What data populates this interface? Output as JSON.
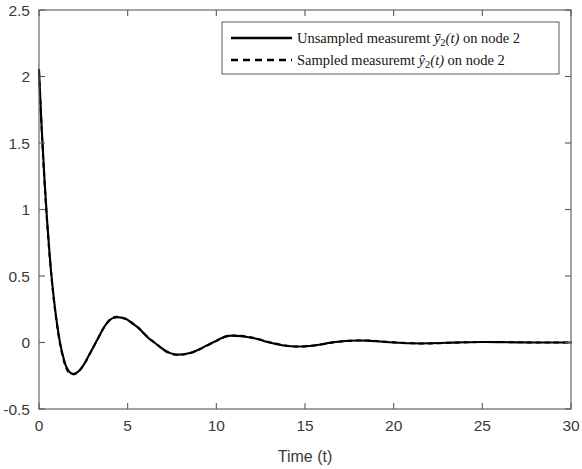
{
  "chart_data": {
    "type": "line",
    "title": "",
    "xlabel": "Time (t)",
    "ylabel": "",
    "xlim": [
      0,
      30
    ],
    "ylim": [
      -0.5,
      2.5
    ],
    "xticks": [
      0,
      5,
      10,
      15,
      20,
      25,
      30
    ],
    "xticklabels": [
      "0",
      "5",
      "10",
      "15",
      "20",
      "25",
      "30"
    ],
    "yticks": [
      -0.5,
      0,
      0.5,
      1,
      1.5,
      2,
      2.5
    ],
    "yticklabels": [
      "-0.5",
      "0",
      "0.5",
      "1",
      "1.5",
      "2",
      "2.5"
    ],
    "grid": false,
    "legend_position": "top-center",
    "series": [
      {
        "name": "Unsampled measuremt ȳ2(t) on node 2",
        "label_prefix": "Unsampled measuremt",
        "label_symbol": "y",
        "label_accent": "bar",
        "label_subscript": "2",
        "label_arg": "(t)",
        "label_suffix": "on node 2",
        "style": "solid",
        "color": "#000000",
        "x": [
          0,
          0.15,
          0.3,
          0.45,
          0.6,
          0.75,
          0.9,
          1.05,
          1.2,
          1.35,
          1.5,
          1.65,
          1.8,
          2.0,
          2.2,
          2.4,
          2.6,
          2.8,
          3.0,
          3.2,
          3.4,
          3.6,
          3.8,
          4.0,
          4.2,
          4.4,
          4.6,
          4.8,
          5.0,
          5.3,
          5.6,
          5.9,
          6.2,
          6.5,
          6.8,
          7.1,
          7.4,
          7.7,
          8.0,
          8.3,
          8.6,
          8.9,
          9.2,
          9.5,
          9.8,
          10.1,
          10.4,
          10.7,
          11.0,
          11.4,
          11.8,
          12.2,
          12.6,
          13.0,
          13.4,
          13.8,
          14.2,
          14.6,
          15.0,
          15.5,
          16.0,
          16.5,
          17.0,
          17.5,
          18.0,
          18.5,
          19.0,
          19.5,
          20.0,
          20.5,
          21.0,
          21.5,
          22.0,
          23.0,
          24.0,
          25.0,
          26.0,
          27.0,
          28.0,
          29.0,
          30.0
        ],
        "y": [
          2.05,
          1.62,
          1.25,
          0.93,
          0.66,
          0.44,
          0.26,
          0.11,
          -0.01,
          -0.1,
          -0.17,
          -0.21,
          -0.23,
          -0.235,
          -0.22,
          -0.19,
          -0.15,
          -0.1,
          -0.05,
          0.0,
          0.05,
          0.1,
          0.14,
          0.17,
          0.185,
          0.19,
          0.188,
          0.18,
          0.17,
          0.14,
          0.11,
          0.07,
          0.03,
          0.0,
          -0.03,
          -0.06,
          -0.08,
          -0.09,
          -0.09,
          -0.085,
          -0.075,
          -0.06,
          -0.04,
          -0.02,
          0.0,
          0.02,
          0.04,
          0.05,
          0.05,
          0.048,
          0.04,
          0.03,
          0.015,
          0.0,
          -0.012,
          -0.022,
          -0.028,
          -0.03,
          -0.028,
          -0.022,
          -0.012,
          0.0,
          0.008,
          0.013,
          0.015,
          0.014,
          0.01,
          0.005,
          0.0,
          -0.004,
          -0.006,
          -0.007,
          -0.006,
          -0.002,
          0.002,
          0.004,
          0.003,
          0.001,
          0.0,
          0.0,
          0.0
        ]
      },
      {
        "name": "Sampled measuremt ŷ2(t) on node 2",
        "label_prefix": "Sampled measuremt",
        "label_symbol": "y",
        "label_accent": "hat",
        "label_subscript": "2",
        "label_arg": "(t)",
        "label_suffix": "on node 2",
        "style": "dashed",
        "color": "#000000",
        "x": [
          0,
          0.15,
          0.3,
          0.45,
          0.6,
          0.75,
          0.9,
          1.05,
          1.2,
          1.35,
          1.5,
          1.65,
          1.8,
          2.0,
          2.2,
          2.4,
          2.6,
          2.8,
          3.0,
          3.2,
          3.4,
          3.6,
          3.8,
          4.0,
          4.2,
          4.4,
          4.6,
          4.8,
          5.0,
          5.3,
          5.6,
          5.9,
          6.2,
          6.5,
          6.8,
          7.1,
          7.4,
          7.7,
          8.0,
          8.3,
          8.6,
          8.9,
          9.2,
          9.5,
          9.8,
          10.1,
          10.4,
          10.7,
          11.0,
          11.4,
          11.8,
          12.2,
          12.6,
          13.0,
          13.4,
          13.8,
          14.2,
          14.6,
          15.0,
          15.5,
          16.0,
          16.5,
          17.0,
          17.5,
          18.0,
          18.5,
          19.0,
          19.5,
          20.0,
          20.5,
          21.0,
          21.5,
          22.0,
          23.0,
          24.0,
          25.0,
          26.0,
          27.0,
          28.0,
          29.0,
          30.0
        ],
        "y": [
          2.03,
          1.6,
          1.23,
          0.92,
          0.65,
          0.43,
          0.25,
          0.1,
          -0.02,
          -0.11,
          -0.18,
          -0.22,
          -0.235,
          -0.238,
          -0.222,
          -0.192,
          -0.152,
          -0.102,
          -0.052,
          -0.002,
          0.048,
          0.1,
          0.142,
          0.172,
          0.188,
          0.193,
          0.19,
          0.182,
          0.172,
          0.142,
          0.112,
          0.072,
          0.032,
          0.002,
          -0.032,
          -0.062,
          -0.082,
          -0.092,
          -0.092,
          -0.087,
          -0.077,
          -0.062,
          -0.042,
          -0.022,
          -0.002,
          0.018,
          0.038,
          0.052,
          0.052,
          0.05,
          0.042,
          0.032,
          0.017,
          0.002,
          -0.01,
          -0.02,
          -0.027,
          -0.03,
          -0.029,
          -0.023,
          -0.013,
          -0.001,
          0.007,
          0.012,
          0.015,
          0.015,
          0.011,
          0.006,
          0.001,
          -0.003,
          -0.006,
          -0.007,
          -0.007,
          -0.003,
          0.001,
          0.004,
          0.004,
          0.002,
          0.0,
          0.0,
          0.0
        ]
      }
    ]
  },
  "axes": {
    "xlabel": "Time (t)"
  }
}
